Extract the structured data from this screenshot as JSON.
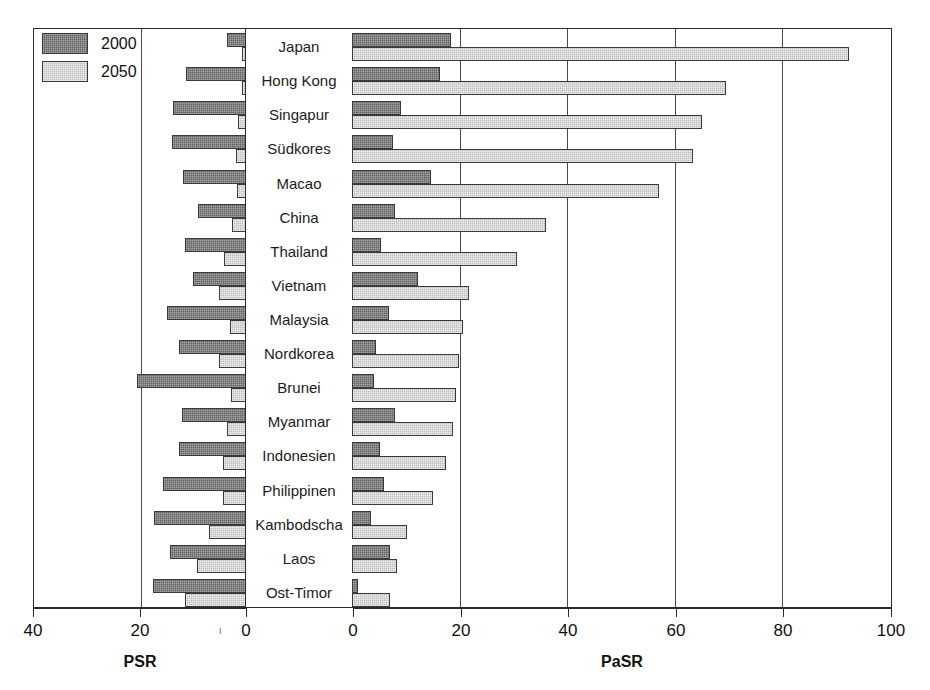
{
  "legend": {
    "items": [
      {
        "label": "2000",
        "swatch": "dark"
      },
      {
        "label": "2050",
        "swatch": "light"
      }
    ]
  },
  "axes": {
    "left": {
      "title": "PSR",
      "ticks": [
        "40",
        "20",
        "0"
      ],
      "tick_values": [
        40,
        20,
        0
      ],
      "max": 40,
      "direction": "right-to-left"
    },
    "right": {
      "title": "PaSR",
      "ticks": [
        "0",
        "20",
        "40",
        "60",
        "80",
        "100"
      ],
      "tick_values": [
        0,
        20,
        40,
        60,
        80,
        100
      ],
      "max": 100,
      "direction": "left-to-right"
    },
    "stray_mark": "ι"
  },
  "chart_data": {
    "type": "bar",
    "orientation": "horizontal",
    "layout": "back-to-back dual-axis population pyramid style",
    "title": "",
    "subtitle": "",
    "xlabel_left": "PSR",
    "xlabel_right": "PaSR",
    "ylabel": "",
    "grid": true,
    "legend_position": "top-left",
    "xlim_left": [
      40,
      0
    ],
    "xlim_right": [
      0,
      100
    ],
    "categories": [
      "Japan",
      "Hong Kong",
      "Singapur",
      "Südkores",
      "Macao",
      "China",
      "Thailand",
      "Vietnam",
      "Malaysia",
      "Nordkorea",
      "Brunei",
      "Myanmar",
      "Indonesien",
      "Philippinen",
      "Kambodscha",
      "Laos",
      "Ost-Timor"
    ],
    "panels": [
      {
        "name": "PSR",
        "axis": "left",
        "series": [
          {
            "name": "2000",
            "values": [
              3.7,
              11.5,
              13.9,
              14.0,
              12.1,
              9.2,
              11.6,
              10.2,
              15.0,
              12.7,
              20.7,
              12.2,
              12.7,
              15.8,
              17.4,
              14.4,
              17.7
            ]
          },
          {
            "name": "2050",
            "values": [
              1.0,
              1.0,
              1.7,
              2.0,
              1.9,
              2.8,
              4.3,
              5.2,
              3.2,
              5.2,
              3.0,
              3.8,
              4.5,
              4.6,
              7.2,
              9.3,
              11.7
            ]
          }
        ]
      },
      {
        "name": "PaSR",
        "axis": "right",
        "series": [
          {
            "name": "2000",
            "values": [
              18.4,
              16.4,
              9.2,
              7.7,
              14.6,
              7.9,
              5.3,
              12.2,
              6.9,
              4.5,
              4.0,
              8.0,
              5.2,
              5.9,
              3.5,
              7.0,
              1.1
            ]
          },
          {
            "name": "2050",
            "values": [
              92.4,
              69.6,
              65.0,
              63.3,
              57.1,
              36.0,
              30.7,
              21.8,
              20.6,
              19.9,
              19.4,
              18.7,
              17.4,
              15.0,
              10.3,
              8.4,
              7.0
            ]
          }
        ]
      }
    ]
  }
}
